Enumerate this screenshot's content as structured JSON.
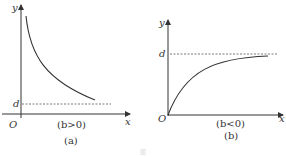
{
  "figures": [
    {
      "id": "a",
      "y_label": "y",
      "x_label": "x",
      "origin_label": "O",
      "asymptote_label": "d",
      "condition": "(b>0)",
      "caption": "(a)",
      "curve": "decreasing toward asymptote d"
    },
    {
      "id": "b",
      "y_label": "y",
      "x_label": "x",
      "origin_label": "O",
      "asymptote_label": "d",
      "condition": "(b<0)",
      "caption": "(b)",
      "curve": "increasing from origin toward asymptote d"
    }
  ],
  "figure_caption": "图",
  "colors": {
    "line": "#333333",
    "dashed": "#555555"
  }
}
